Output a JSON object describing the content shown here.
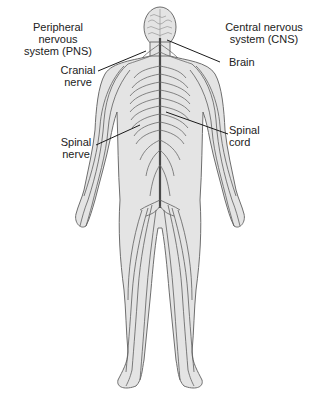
{
  "diagram": {
    "type": "anatomical illustration",
    "colors": {
      "background": "#ffffff",
      "body_fill": "#e4e4e4",
      "body_outline": "#6e6e6e",
      "nerve": "#5a5a5a",
      "spinal_cord": "#4a4a4a",
      "leader_line": "#1a1a1a",
      "text": "#222222"
    }
  },
  "labels": {
    "pns": {
      "line1": "Peripheral nervous",
      "line2": "system (PNS)"
    },
    "cns": {
      "line1": "Central nervous",
      "line2": "system (CNS)"
    },
    "cranial_nerve": {
      "line1": "Cranial",
      "line2": "nerve"
    },
    "brain": {
      "line1": "Brain"
    },
    "spinal_nerve": {
      "line1": "Spinal",
      "line2": "nerve"
    },
    "spinal_cord": {
      "line1": "Spinal",
      "line2": "cord"
    }
  }
}
